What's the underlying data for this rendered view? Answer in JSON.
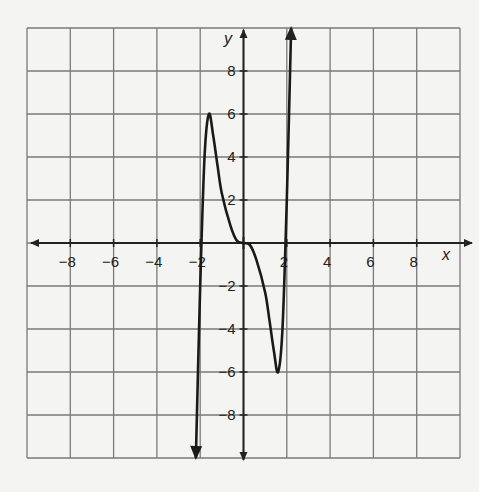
{
  "chart_data": {
    "type": "line",
    "title": "",
    "xlabel": "x",
    "ylabel": "y",
    "xlim": [
      -10,
      10
    ],
    "ylim": [
      -10,
      10
    ],
    "grid": true,
    "grid_step": 2,
    "x_ticks": [
      "-8",
      "-6",
      "-4",
      "-2",
      "2",
      "4",
      "6",
      "8"
    ],
    "y_ticks": [
      "8",
      "6",
      "4",
      "2",
      "-2",
      "-4",
      "-6",
      "-8"
    ],
    "series": [
      {
        "name": "f(x)",
        "description": "odd polynomial-like curve with arrows at both ends",
        "x": [
          -2.2,
          -2.0,
          -1.8,
          -1.6,
          -1.4,
          -1.2,
          -1.0,
          -0.6,
          -0.3,
          0,
          0.3,
          0.6,
          1.0,
          1.2,
          1.4,
          1.6,
          1.8,
          2.0,
          2.2
        ],
        "y": [
          -10,
          -2,
          4,
          6,
          5,
          3.6,
          2.3,
          0.8,
          0.1,
          0,
          -0.1,
          -0.8,
          -2.3,
          -3.6,
          -5,
          -6,
          -4,
          2,
          10
        ],
        "local_max": {
          "x": -1.6,
          "y": 6
        },
        "local_min": {
          "x": 1.6,
          "y": -6
        }
      }
    ]
  },
  "labels": {
    "x_axis": "x",
    "y_axis": "y"
  }
}
